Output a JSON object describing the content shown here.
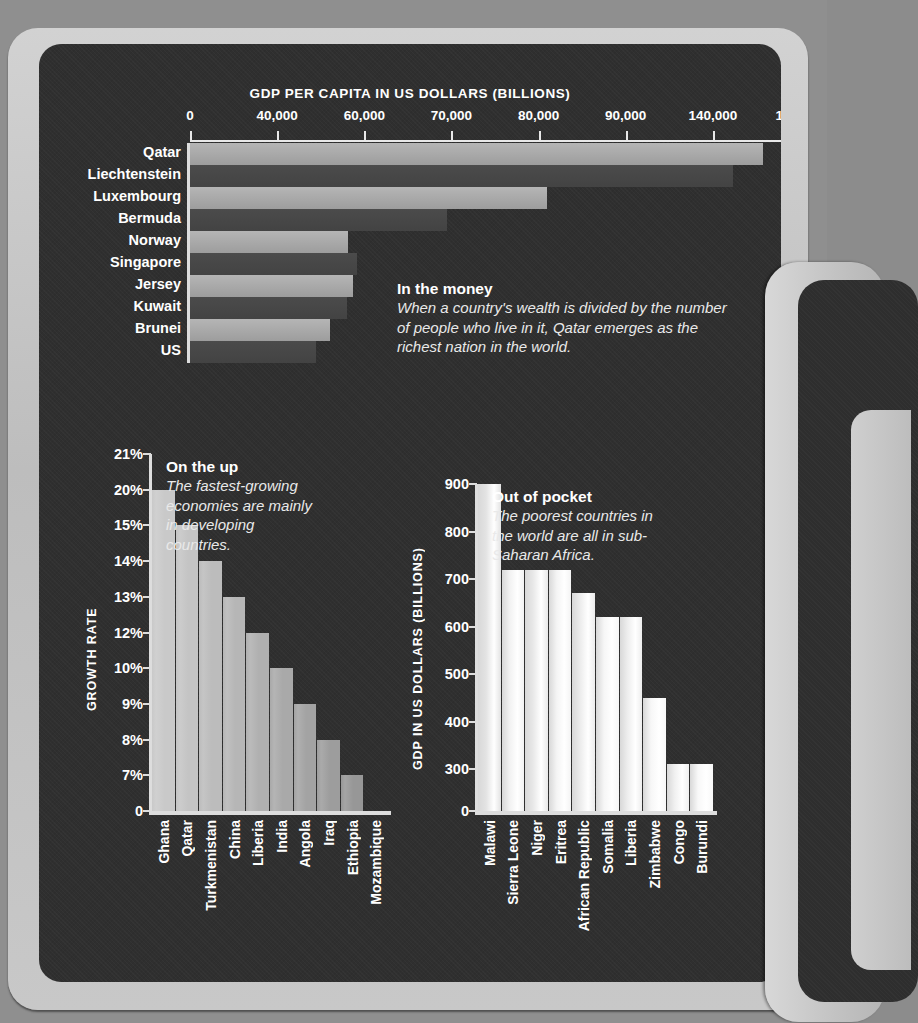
{
  "chart_data": [
    {
      "type": "bar",
      "orientation": "horizontal",
      "title": "GDP PER CAPITA IN US DOLLARS (BILLIONS)",
      "xlabel": "",
      "ylabel": "",
      "grid": false,
      "tick_labels": [
        "0",
        "40,000",
        "60,000",
        "70,000",
        "80,000",
        "90,000",
        "140,000",
        "150,000"
      ],
      "categories": [
        "Qatar",
        "Liechtenstein",
        "Luxembourg",
        "Bermuda",
        "Norway",
        "Singapore",
        "Jersey",
        "Kuwait",
        "Brunei",
        "US"
      ],
      "values": [
        146000,
        142500,
        90500,
        78000,
        61000,
        54500,
        53000,
        51500,
        49500,
        47500
      ],
      "callout": {
        "heading": "In the money",
        "body": "When a country's wealth is divided by the number of people who live in it, Qatar emerges as the richest nation in the world."
      }
    },
    {
      "type": "bar",
      "orientation": "vertical",
      "title": "",
      "ylabel": "GROWTH RATE",
      "ylim": [
        0,
        21
      ],
      "grid": false,
      "tick_labels": [
        "21%",
        "20%",
        "15%",
        "14%",
        "13%",
        "12%",
        "10%",
        "9%",
        "8%",
        "7%",
        "0"
      ],
      "categories": [
        "Ghana",
        "Qatar",
        "Turkmenistan",
        "China",
        "Liberia",
        "India",
        "Angola",
        "Iraq",
        "Ethiopia",
        "Mozambique"
      ],
      "values": [
        20,
        15,
        14,
        13,
        12,
        10,
        9,
        8,
        7,
        7
      ],
      "callout": {
        "heading": "On the up",
        "body": "The fastest-growing economies are mainly in developing countries."
      }
    },
    {
      "type": "bar",
      "orientation": "vertical",
      "title": "",
      "ylabel": "GDP IN US DOLLARS (BILLIONS)",
      "ylim": [
        0,
        900
      ],
      "grid": false,
      "tick_labels": [
        "900",
        "800",
        "700",
        "600",
        "500",
        "400",
        "300",
        "0"
      ],
      "categories": [
        "Malawi",
        "Sierra Leone",
        "Niger",
        "Eritrea",
        "African Republic",
        "Somalia",
        "Liberia",
        "Zimbabwe",
        "Congo",
        "Burundi"
      ],
      "values": [
        900,
        720,
        720,
        720,
        670,
        620,
        620,
        450,
        310,
        310
      ],
      "callout": {
        "heading": "Out of pocket",
        "body": "The poorest countries in the world are all in sub-Saharan Africa."
      }
    }
  ],
  "top": {
    "title": "GDP PER CAPITA IN US DOLLARS (BILLIONS)",
    "ticks": [
      "0",
      "40,000",
      "60,000",
      "70,000",
      "80,000",
      "90,000",
      "140,000",
      "150,000"
    ],
    "rows": [
      {
        "label": "Qatar",
        "w": 573
      },
      {
        "label": "Liechtenstein",
        "w": 543
      },
      {
        "label": "Luxembourg",
        "w": 357
      },
      {
        "label": "Bermuda",
        "w": 257
      },
      {
        "label": "Norway",
        "w": 158
      },
      {
        "label": "Singapore",
        "w": 167
      },
      {
        "label": "Jersey",
        "w": 163
      },
      {
        "label": "Kuwait",
        "w": 157
      },
      {
        "label": "Brunei",
        "w": 140
      },
      {
        "label": "US",
        "w": 126
      }
    ],
    "callout_heading": "In the money",
    "callout_body": "When a country's wealth is divided by the number of people who live in it, Qatar emerges as the richest nation in the world."
  },
  "left": {
    "ylabel": "GROWTH RATE",
    "ticks": [
      "21%",
      "20%",
      "15%",
      "14%",
      "13%",
      "12%",
      "10%",
      "9%",
      "8%",
      "7%",
      "0"
    ],
    "categories": [
      "Ghana",
      "Qatar",
      "Turkmenistan",
      "China",
      "Liberia",
      "India",
      "Angola",
      "Iraq",
      "Ethiopia",
      "Mozambique"
    ],
    "callout_heading": "On the up",
    "callout_body": "The fastest-growing economies are mainly in developing countries."
  },
  "right": {
    "ylabel": "GDP IN US DOLLARS (BILLIONS)",
    "ticks": [
      "900",
      "800",
      "700",
      "600",
      "500",
      "400",
      "300",
      "0"
    ],
    "categories": [
      "Malawi",
      "Sierra Leone",
      "Niger",
      "Eritrea",
      "African Republic",
      "Somalia",
      "Liberia",
      "Zimbabwe",
      "Congo",
      "Burundi"
    ],
    "callout_heading": "Out of pocket",
    "callout_body": "The poorest countries in the world are all in sub-Saharan Africa."
  }
}
